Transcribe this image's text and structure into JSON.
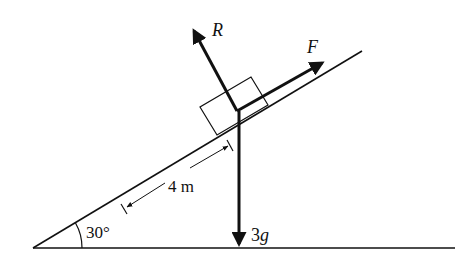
{
  "diagram": {
    "type": "free-body diagram on inclined plane",
    "angle_label": "30°",
    "distance_label": "4 m",
    "forces": {
      "normal": "R",
      "applied": "F",
      "weight_coef": "3",
      "weight_sym": "g"
    },
    "colors": {
      "ink": "#111111",
      "background": "#ffffff"
    }
  }
}
